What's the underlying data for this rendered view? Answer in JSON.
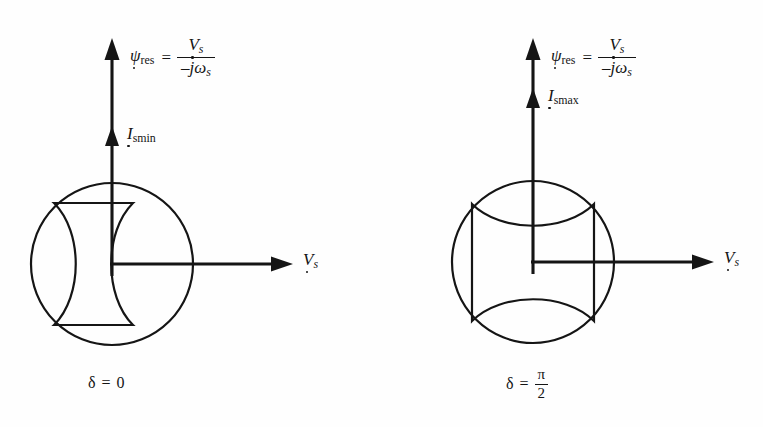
{
  "figure": {
    "background_color": "#fefefe",
    "ink_color": "#151515",
    "panels": [
      {
        "id": "delta-zero",
        "vertical_axis": {
          "quantity_symbol": "ψ",
          "quantity_subscript": "res",
          "equals": "=",
          "numerator_symbol": "V",
          "numerator_subscript": "s",
          "denominator": "–jω",
          "denominator_subscript": "s"
        },
        "current_marker": {
          "symbol": "I",
          "subscript": "smin"
        },
        "horizontal_axis": {
          "symbol": "V",
          "subscript": "s"
        },
        "caption": {
          "symbol": "δ",
          "equals": "=",
          "value": "0",
          "is_fraction": false,
          "numerator": "",
          "denominator": ""
        },
        "circle": {
          "cx": 112,
          "cy": 264,
          "r": 81
        },
        "bowtie_orientation": "vertical"
      },
      {
        "id": "delta-half-pi",
        "vertical_axis": {
          "quantity_symbol": "ψ",
          "quantity_subscript": "res",
          "equals": "=",
          "numerator_symbol": "V",
          "numerator_subscript": "s",
          "denominator": "–jω",
          "denominator_subscript": "s"
        },
        "current_marker": {
          "symbol": "I",
          "subscript": "smax"
        },
        "horizontal_axis": {
          "symbol": "V",
          "subscript": "s"
        },
        "caption": {
          "symbol": "δ",
          "equals": "=",
          "value": "",
          "is_fraction": true,
          "numerator": "π",
          "denominator": "2"
        },
        "circle": {
          "cx": 152,
          "cy": 262,
          "r": 81
        },
        "bowtie_orientation": "horizontal"
      }
    ]
  }
}
